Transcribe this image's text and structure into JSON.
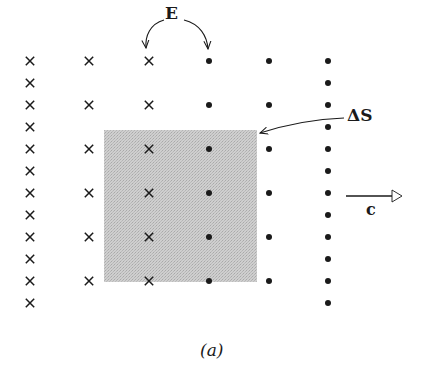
{
  "figure": {
    "caption": "(a)",
    "labels": {
      "field": "E",
      "surface": "ΔS",
      "velocity": "c"
    },
    "grid": {
      "rows_y": [
        61,
        83,
        105,
        127,
        149,
        171,
        193,
        215,
        237,
        259,
        281,
        303
      ],
      "columns": [
        {
          "x": 30,
          "symbol": "cross",
          "rows": "all"
        },
        {
          "x": 89,
          "symbol": "cross",
          "rows": "every-other"
        },
        {
          "x": 149,
          "symbol": "cross",
          "rows": "every-other"
        },
        {
          "x": 209,
          "symbol": "dot",
          "rows": "every-other"
        },
        {
          "x": 269,
          "symbol": "dot",
          "rows": "every-other"
        },
        {
          "x": 328,
          "symbol": "dot",
          "rows": "all"
        }
      ]
    },
    "shaded_area": {
      "x": 104,
      "y": 130,
      "width": 153,
      "height": 152,
      "color": "#c8c8c8"
    },
    "colors": {
      "ink": "#1a1a1a",
      "shade": "#c8c8c8"
    }
  }
}
